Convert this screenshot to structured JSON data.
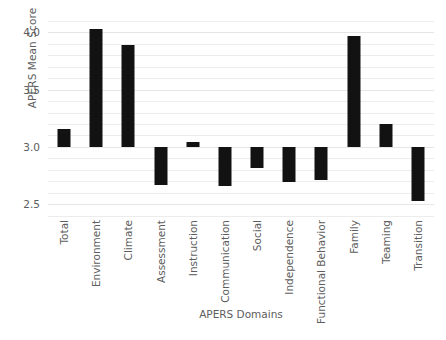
{
  "chart_data": {
    "type": "bar",
    "title": "",
    "xlabel": "APERS Domains",
    "ylabel": "APERS Mean Score",
    "categories": [
      "Total",
      "Environment",
      "Climate",
      "Assessment",
      "Instruction",
      "Communication",
      "Social",
      "Independence",
      "Functional Behavior",
      "Family",
      "Teaming",
      "Transition"
    ],
    "values": [
      3.16,
      4.03,
      3.89,
      2.67,
      3.04,
      2.66,
      2.82,
      2.69,
      2.71,
      3.97,
      3.2,
      2.53
    ],
    "baseline": 3.0,
    "ylim": [
      2.38,
      4.16
    ],
    "yticks": [
      2.5,
      3.0,
      3.5,
      4.0
    ],
    "ytick_labels": [
      "2.5",
      "3.0",
      "3.5",
      "4.0"
    ],
    "minor_gridline_step": 0.1,
    "grid": true,
    "legend": false,
    "bar_color": "#121212",
    "gridline_color": "#ececed"
  }
}
